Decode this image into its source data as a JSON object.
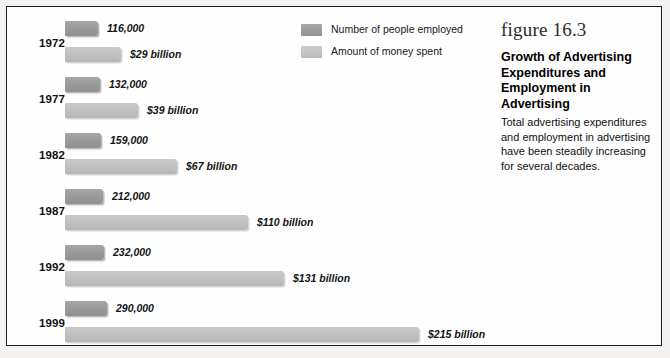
{
  "figure": {
    "number_label": "figure 16.3",
    "title": "Growth of Advertising Expenditures and Employment in Advertising",
    "caption": "Total advertising expenditures and employment in advertising have been steadily increasing for several decades."
  },
  "legend": {
    "items": [
      {
        "label": "Number of people employed",
        "swatch": "employed",
        "color": "#9b9b9b"
      },
      {
        "label": "Amount of money spent",
        "swatch": "money",
        "color": "#c2c2c2"
      }
    ]
  },
  "colors": {
    "employed_bar": "#9b9b9b",
    "money_bar": "#c2c2c2",
    "frame": "#1c1c1c",
    "background": "#fefefe",
    "text": "#111111"
  },
  "chart_data": {
    "type": "bar",
    "orientation": "horizontal",
    "title": "Growth of Advertising Expenditures and Employment in Advertising",
    "xlabel": "",
    "ylabel": "",
    "categories": [
      "1972",
      "1977",
      "1982",
      "1987",
      "1992",
      "1999"
    ],
    "series": [
      {
        "name": "Number of people employed",
        "unit": "people",
        "color": "#9b9b9b",
        "values": [
          116000,
          132000,
          159000,
          212000,
          232000,
          290000
        ],
        "labels": [
          "116,000",
          "132,000",
          "159,000",
          "212,000",
          "232,000",
          "290,000"
        ]
      },
      {
        "name": "Amount of money spent",
        "unit": "billions of dollars",
        "color": "#c2c2c2",
        "values": [
          29,
          39,
          67,
          110,
          131,
          215
        ],
        "labels": [
          "$29 billion",
          "$39 billion",
          "$67 billion",
          "$110 billion",
          "$131 billion",
          "$215 billion"
        ]
      }
    ],
    "grid": false,
    "legend_position": "top-center"
  },
  "rows": [
    {
      "year": "1972",
      "employed_label": "116,000",
      "money_label": "$29 billion",
      "employed_px": 33,
      "money_px": 56,
      "top": 14
    },
    {
      "year": "1977",
      "employed_label": "132,000",
      "money_label": "$39 billion",
      "employed_px": 35,
      "money_px": 73,
      "top": 70
    },
    {
      "year": "1982",
      "employed_label": "159,000",
      "money_label": "$67 billion",
      "employed_px": 36,
      "money_px": 112,
      "top": 126
    },
    {
      "year": "1987",
      "employed_label": "212,000",
      "money_label": "$110 billion",
      "employed_px": 38,
      "money_px": 183,
      "top": 182
    },
    {
      "year": "1992",
      "employed_label": "232,000",
      "money_label": "$131 billion",
      "employed_px": 39,
      "money_px": 219,
      "top": 238
    },
    {
      "year": "1999",
      "employed_label": "290,000",
      "money_label": "$215 billion",
      "employed_px": 42,
      "money_px": 354,
      "top": 294
    }
  ]
}
